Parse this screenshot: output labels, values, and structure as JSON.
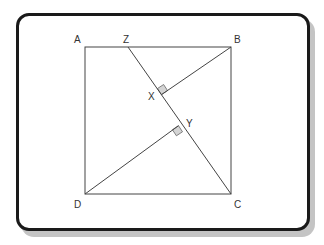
{
  "diagram": {
    "type": "geometry",
    "shape": "square ABCD with segment ZC and perpendiculars BX and DY",
    "labels": {
      "A": "A",
      "B": "B",
      "C": "C",
      "D": "D",
      "Z": "Z",
      "X": "X",
      "Y": "Y"
    },
    "colors": {
      "line": "#444444",
      "frame": "#1a1a1a",
      "shadow": "#c4c4c4",
      "right_angle_fill": "#d4d4d4"
    }
  }
}
